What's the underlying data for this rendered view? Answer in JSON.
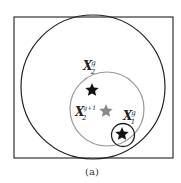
{
  "diagram": {
    "caption": "(a)",
    "labels": {
      "x2g": {
        "base": "X",
        "sub": "2",
        "sup": "g"
      },
      "x2g1": {
        "base": "X",
        "sub": "2",
        "sup": "g+1"
      },
      "x1g": {
        "base": "X",
        "sub": "1",
        "sup": "g"
      }
    },
    "colors": {
      "frame": "#333333",
      "outer_circle": "#222222",
      "middle_circle": "#999999",
      "small_circle": "#222222",
      "star_dark": "#111111",
      "star_gray": "#888888"
    }
  }
}
